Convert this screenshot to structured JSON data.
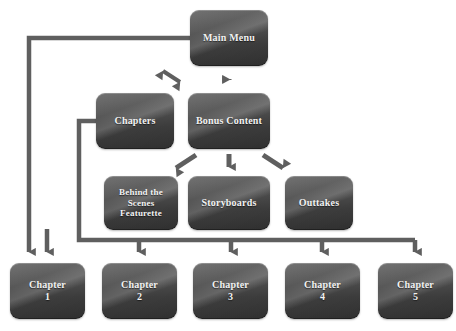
{
  "diagram": {
    "type": "flowchart",
    "background_color": "#ffffff",
    "node_fill_color": "#4d4d4d",
    "node_text_color": "#f2f2f2",
    "connector_color": "#666666",
    "nodes": [
      {
        "id": "main_menu",
        "label": "Main Menu",
        "level": 1
      },
      {
        "id": "chapters",
        "label": "Chapters",
        "level": 2
      },
      {
        "id": "bonus",
        "label": "Bonus Content",
        "level": 2
      },
      {
        "id": "behind",
        "label": "Behind the\nScenes\nFeaturette",
        "level": 3
      },
      {
        "id": "storyboards",
        "label": "Storyboards",
        "level": 3
      },
      {
        "id": "outtakes",
        "label": "Outtakes",
        "level": 3
      },
      {
        "id": "chapter_1",
        "label": "Chapter\n1",
        "level": 4
      },
      {
        "id": "chapter_2",
        "label": "Chapter\n2",
        "level": 4
      },
      {
        "id": "chapter_3",
        "label": "Chapter\n3",
        "level": 4
      },
      {
        "id": "chapter_4",
        "label": "Chapter\n4",
        "level": 4
      },
      {
        "id": "chapter_5",
        "label": "Chapter\n5",
        "level": 4
      }
    ],
    "edges": [
      {
        "from": "main_menu",
        "to": "chapters",
        "style": "double-arrow-diagonal"
      },
      {
        "from": "main_menu",
        "to": "bonus",
        "style": "double-arrow-vertical"
      },
      {
        "from": "main_menu",
        "to": "chapter_1",
        "style": "routed-left"
      },
      {
        "from": "bonus",
        "to": "behind",
        "style": "arrow-diagonal-left"
      },
      {
        "from": "bonus",
        "to": "storyboards",
        "style": "arrow-vertical"
      },
      {
        "from": "bonus",
        "to": "outtakes",
        "style": "arrow-diagonal-right"
      },
      {
        "from": "chapters",
        "to": "chapter_1",
        "style": "routed-bus"
      },
      {
        "from": "chapters",
        "to": "chapter_2",
        "style": "routed-bus"
      },
      {
        "from": "chapters",
        "to": "chapter_3",
        "style": "routed-bus"
      },
      {
        "from": "chapters",
        "to": "chapter_4",
        "style": "routed-bus"
      },
      {
        "from": "chapters",
        "to": "chapter_5",
        "style": "routed-bus"
      }
    ]
  }
}
